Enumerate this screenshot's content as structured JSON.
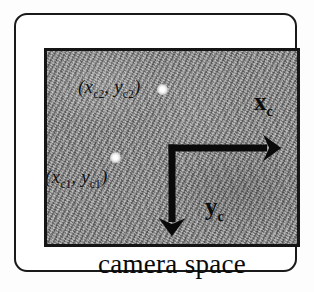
{
  "figure": {
    "caption": "camera space",
    "frame_border_color": "#1a1a1a",
    "panel_background_color": "#909090",
    "panel_border_color": "#151515"
  },
  "image_panel": {
    "description": "grainy gray textured camera image",
    "feature_points": [
      {
        "id": "point-2",
        "label_prefix": "(",
        "x_symbol": "x",
        "x_sub": "c2",
        "separator": ", ",
        "y_symbol": "y",
        "y_sub": "c2",
        "label_suffix": ")",
        "dot_x": 160,
        "dot_y": 87
      },
      {
        "id": "point-1",
        "label_prefix": "(",
        "x_symbol": "x",
        "x_sub": "c1",
        "separator": ", ",
        "y_symbol": "y",
        "y_sub": "c1",
        "label_suffix": ")",
        "dot_x": 113,
        "dot_y": 155
      }
    ]
  },
  "axes": {
    "origin": {
      "x": 156,
      "y": 133
    },
    "x_axis": {
      "symbol": "x",
      "subscript": "c",
      "direction": "right",
      "tip_x": 264,
      "tip_y": 133
    },
    "y_axis": {
      "symbol": "y",
      "subscript": "c",
      "direction": "down",
      "tip_x": 156,
      "tip_y": 220
    },
    "stroke_color": "#0a0a0a"
  }
}
